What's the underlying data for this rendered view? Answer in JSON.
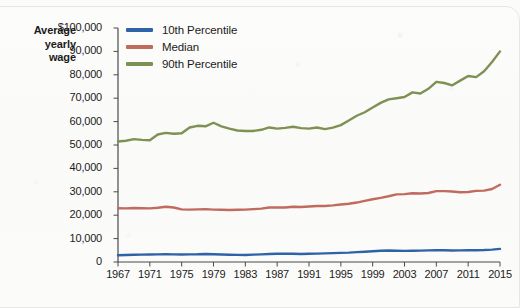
{
  "chart_data": {
    "type": "line",
    "title": "",
    "ylabel": "Average yearly wage",
    "xlabel": "",
    "ylim": [
      0,
      100000
    ],
    "xlim": [
      1967,
      2015
    ],
    "grid": false,
    "legend_position": "top-left",
    "ytick_labels": [
      "$100,000",
      "90,000",
      "80,000",
      "70,000",
      "60,000",
      "50,000",
      "40,000",
      "30,000",
      "20,000",
      "10,000",
      "0"
    ],
    "ytick_values": [
      100000,
      90000,
      80000,
      70000,
      60000,
      50000,
      40000,
      30000,
      20000,
      10000,
      0
    ],
    "xtick_labels": [
      "1967",
      "1971",
      "1975",
      "1979",
      "1983",
      "1987",
      "1991",
      "1995",
      "1999",
      "2003",
      "2007",
      "2011",
      "2015"
    ],
    "xtick_values": [
      1967,
      1971,
      1975,
      1979,
      1983,
      1987,
      1991,
      1995,
      1999,
      2003,
      2007,
      2011,
      2015
    ],
    "x": [
      1967,
      1968,
      1969,
      1970,
      1971,
      1972,
      1973,
      1974,
      1975,
      1976,
      1977,
      1978,
      1979,
      1980,
      1981,
      1982,
      1983,
      1984,
      1985,
      1986,
      1987,
      1988,
      1989,
      1990,
      1991,
      1992,
      1993,
      1994,
      1995,
      1996,
      1997,
      1998,
      1999,
      2000,
      2001,
      2002,
      2003,
      2004,
      2005,
      2006,
      2007,
      2008,
      2009,
      2010,
      2011,
      2012,
      2013,
      2014,
      2015
    ],
    "series": [
      {
        "name": "10th Percentile",
        "color": "#2f63a8",
        "values": [
          2900,
          3000,
          3100,
          3150,
          3200,
          3250,
          3300,
          3250,
          3200,
          3250,
          3300,
          3450,
          3300,
          3200,
          3100,
          3050,
          3000,
          3150,
          3250,
          3400,
          3500,
          3600,
          3500,
          3450,
          3500,
          3600,
          3700,
          3800,
          3900,
          4000,
          4200,
          4400,
          4600,
          4800,
          4900,
          4800,
          4750,
          4800,
          4850,
          4950,
          5050,
          5000,
          4900,
          4950,
          5000,
          5000,
          5100,
          5300,
          5600
        ]
      },
      {
        "name": "Median",
        "color": "#c16a5e",
        "values": [
          23000,
          22900,
          23100,
          23000,
          22900,
          23200,
          23600,
          23300,
          22500,
          22400,
          22500,
          22600,
          22400,
          22300,
          22200,
          22300,
          22400,
          22600,
          22800,
          23300,
          23300,
          23300,
          23600,
          23500,
          23700,
          23900,
          23900,
          24200,
          24600,
          24900,
          25400,
          26100,
          26800,
          27400,
          28100,
          28900,
          29000,
          29400,
          29300,
          29500,
          30300,
          30300,
          30100,
          29800,
          29900,
          30400,
          30500,
          31200,
          33000
        ]
      },
      {
        "name": "90th Percentile",
        "color": "#7e9152",
        "values": [
          51500,
          51800,
          52500,
          52200,
          52000,
          54500,
          55200,
          54800,
          55000,
          57500,
          58200,
          58000,
          59500,
          58000,
          57000,
          56200,
          56000,
          56000,
          56500,
          57500,
          57000,
          57300,
          57800,
          57200,
          57000,
          57500,
          56800,
          57400,
          58500,
          60500,
          62500,
          64000,
          66000,
          68000,
          69500,
          70000,
          70500,
          72500,
          72000,
          74000,
          77000,
          76500,
          75500,
          77500,
          79500,
          79000,
          81500,
          85500,
          90000
        ]
      }
    ]
  },
  "legend": {
    "items": [
      {
        "label": "10th Percentile",
        "color": "#2f63a8"
      },
      {
        "label": "Median",
        "color": "#c16a5e"
      },
      {
        "label": "90th Percentile",
        "color": "#7e9152"
      }
    ]
  },
  "axis_title": {
    "line1": "Average",
    "line2": "yearly",
    "line3": "wage"
  }
}
